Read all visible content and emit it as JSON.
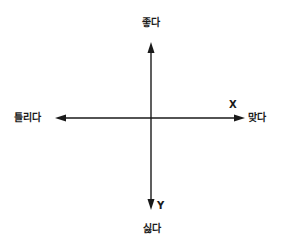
{
  "diagram": {
    "type": "quadrant-axes",
    "axes": {
      "x": {
        "letter": "X",
        "positive_label": "맞다",
        "negative_label": "틀리다"
      },
      "y": {
        "letter": "Y",
        "positive_label": "싫다",
        "negative_label": "좋다"
      }
    },
    "labels": {
      "top": "좋다",
      "left": "틀리다",
      "right": "맞다",
      "bottom": "싫다"
    },
    "colors": {
      "line": "#1a1a1a",
      "text": "#1a1a1a",
      "background": "#ffffff"
    }
  }
}
